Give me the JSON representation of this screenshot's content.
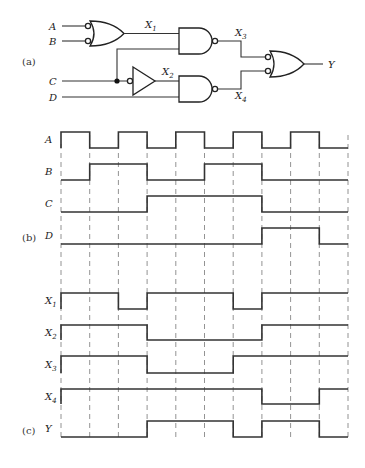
{
  "parts": {
    "a": "(a)",
    "b": "(b)",
    "c": "(c)"
  },
  "circuit": {
    "inputs": [
      {
        "name": "A",
        "label": "A"
      },
      {
        "name": "B",
        "label": "B"
      },
      {
        "name": "C",
        "label": "C"
      },
      {
        "name": "D",
        "label": "D"
      }
    ],
    "nodes": {
      "x1": {
        "main": "X",
        "sub": "1"
      },
      "x2": {
        "main": "X",
        "sub": "2"
      },
      "x3": {
        "main": "X",
        "sub": "3"
      },
      "x4": {
        "main": "X",
        "sub": "4"
      }
    },
    "output": "Y",
    "gates": [
      {
        "id": "g1",
        "type": "OR with inverted inputs",
        "inputs": [
          "A",
          "B"
        ],
        "output": "X1"
      },
      {
        "id": "g2",
        "type": "inverter (bubble input)",
        "inputs": [
          "C"
        ],
        "output": "X2"
      },
      {
        "id": "g3",
        "type": "NAND",
        "inputs": [
          "X1",
          "C"
        ],
        "output": "X3"
      },
      {
        "id": "g4",
        "type": "NAND",
        "inputs": [
          "X2",
          "D"
        ],
        "output": "X4"
      },
      {
        "id": "g5",
        "type": "OR with inverted inputs",
        "inputs": [
          "X3",
          "X4"
        ],
        "output": "Y"
      }
    ]
  },
  "timing": {
    "intervals": 10,
    "grid_x_start": 61,
    "grid_x_end": 348,
    "signals": [
      {
        "name": "A",
        "main": "A",
        "sub": "",
        "high_y": 132,
        "low_y": 148,
        "values": [
          1,
          0,
          1,
          0,
          1,
          0,
          1,
          0,
          1,
          0
        ]
      },
      {
        "name": "B",
        "main": "B",
        "sub": "",
        "high_y": 164,
        "low_y": 180,
        "values": [
          0,
          1,
          1,
          0,
          0,
          1,
          1,
          0,
          0,
          0
        ]
      },
      {
        "name": "C",
        "main": "C",
        "sub": "",
        "high_y": 196,
        "low_y": 212,
        "values": [
          0,
          0,
          0,
          1,
          1,
          1,
          1,
          0,
          0,
          0
        ]
      },
      {
        "name": "D",
        "main": "D",
        "sub": "",
        "high_y": 228,
        "low_y": 244,
        "values": [
          0,
          0,
          0,
          0,
          0,
          0,
          0,
          1,
          1,
          0
        ]
      },
      {
        "name": "X1",
        "main": "X",
        "sub": "1",
        "high_y": 293,
        "low_y": 309,
        "values": [
          1,
          1,
          0,
          1,
          1,
          1,
          0,
          1,
          1,
          1
        ]
      },
      {
        "name": "X2",
        "main": "X",
        "sub": "2",
        "high_y": 325,
        "low_y": 340,
        "values": [
          1,
          1,
          1,
          0,
          0,
          0,
          0,
          1,
          1,
          1
        ]
      },
      {
        "name": "X3",
        "main": "X",
        "sub": "3",
        "high_y": 356,
        "low_y": 373,
        "values": [
          1,
          1,
          1,
          0,
          0,
          0,
          1,
          1,
          1,
          1
        ]
      },
      {
        "name": "X4",
        "main": "X",
        "sub": "4",
        "high_y": 389,
        "low_y": 404,
        "values": [
          1,
          1,
          1,
          1,
          1,
          1,
          1,
          0,
          0,
          1
        ]
      },
      {
        "name": "Y",
        "main": "Y",
        "sub": "",
        "high_y": 421,
        "low_y": 437,
        "values": [
          0,
          0,
          0,
          1,
          1,
          1,
          0,
          1,
          1,
          0
        ]
      }
    ]
  }
}
